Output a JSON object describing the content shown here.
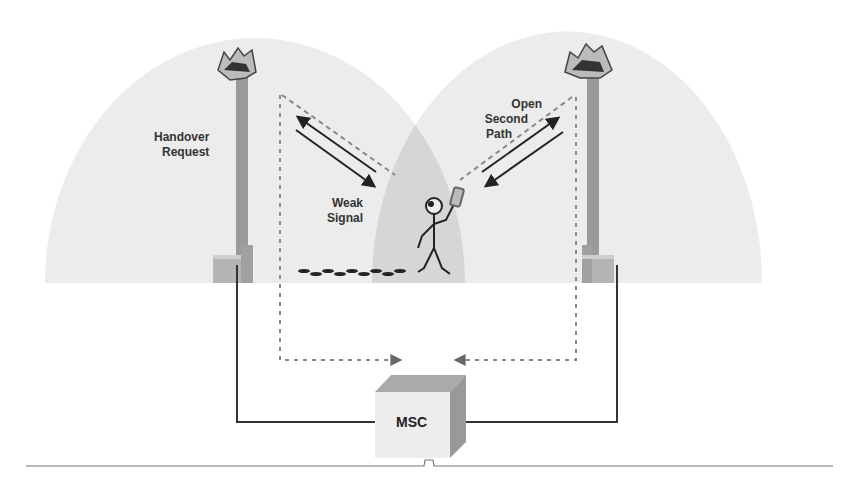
{
  "diagram": {
    "labels": {
      "handover_line1": "Handover",
      "handover_line2": "Request",
      "weak_line1": "Weak",
      "weak_line2": "Signal",
      "open_line1": "Open",
      "open_line2": "Second",
      "open_line3": "Path",
      "msc": "MSC"
    },
    "nodes": [
      {
        "id": "tower-left",
        "type": "cell-tower"
      },
      {
        "id": "tower-right",
        "type": "cell-tower"
      },
      {
        "id": "mobile-user",
        "type": "person-with-phone"
      },
      {
        "id": "msc",
        "type": "switching-center",
        "label": "MSC"
      }
    ],
    "edges": [
      {
        "from": "tower-left",
        "to": "msc",
        "style": "solid"
      },
      {
        "from": "tower-right",
        "to": "msc",
        "style": "solid"
      },
      {
        "from": "tower-left",
        "to": "msc",
        "style": "dashed"
      },
      {
        "from": "tower-right",
        "to": "msc",
        "style": "dashed"
      },
      {
        "from": "tower-left",
        "to": "mobile-user",
        "style": "bidirectional",
        "label": "Weak Signal"
      },
      {
        "from": "tower-right",
        "to": "mobile-user",
        "style": "bidirectional",
        "label": "Open Second Path"
      }
    ],
    "colors": {
      "cell_fill": "#ececec",
      "overlap_fill": "#d9d9d9",
      "tower": "#999999",
      "line": "#333333",
      "dash": "#888888"
    }
  }
}
